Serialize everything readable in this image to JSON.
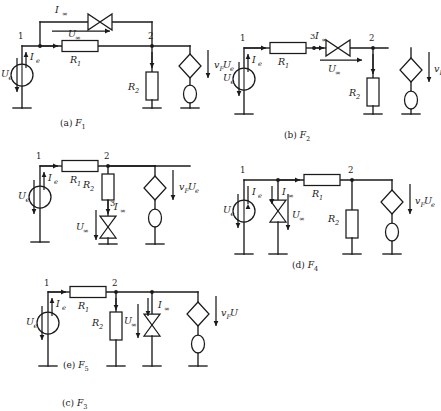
{
  "figure": {
    "background_color": "#ffffff",
    "line_color": "#1a1a1a",
    "width": 441,
    "height": 385
  },
  "symbols": {
    "infinity": "∞",
    "current_source": "bowtie-current-source",
    "voltage_source": "circle-voltage-source",
    "dependent_source": "diamond-dependent-source",
    "ellipse_source": "ellipse-source",
    "resistor": "rectangle-resistor",
    "ground": "ground-symbol"
  },
  "circuits": [
    {
      "id": "a",
      "caption_prefix": "(a)",
      "caption_symbol": "F",
      "caption_subscript": "1",
      "nodes": [
        "1",
        "2"
      ],
      "labels": {
        "source_voltage": "U",
        "source_voltage_sub": "e",
        "source_current": "I",
        "source_current_sub": "e",
        "branch_current": "I",
        "branch_current_sub": "∞",
        "branch_voltage": "U",
        "branch_voltage_sub": "∞",
        "resistor_1": "R",
        "resistor_1_sub": "1",
        "resistor_2": "R",
        "resistor_2_sub": "2",
        "dependent": "v",
        "dependent_sub": "F",
        "dependent_value": "U",
        "dependent_value_sub": "e"
      }
    },
    {
      "id": "b",
      "caption_prefix": "(b)",
      "caption_symbol": "F",
      "caption_subscript": "2",
      "nodes": [
        "1",
        "2"
      ],
      "labels": {
        "source_voltage": "U",
        "source_voltage_sub": "e",
        "source_current": "I",
        "source_current_sub": "e",
        "branch_current_coeff": "3",
        "branch_current": "I",
        "branch_current_sub": "∞",
        "branch_voltage": "U",
        "branch_voltage_sub": "∞",
        "resistor_1": "R",
        "resistor_1_sub": "1",
        "resistor_2": "R",
        "resistor_2_sub": "2",
        "dependent": "v",
        "dependent_sub": "F",
        "dependent_value": "U",
        "dependent_value_sub": "e"
      }
    },
    {
      "id": "c",
      "caption_prefix": "(c)",
      "caption_symbol": "F",
      "caption_subscript": "3",
      "nodes": [
        "1",
        "2"
      ],
      "labels": {
        "source_voltage": "U",
        "source_voltage_sub": "e",
        "source_current": "I",
        "source_current_sub": "e",
        "branch_current_coeff": "3",
        "branch_current": "I",
        "branch_current_sub": "∞",
        "branch_voltage": "U",
        "branch_voltage_sub": "∞",
        "resistor_1": "R",
        "resistor_1_sub": "1",
        "resistor_2": "R",
        "resistor_2_sub": "2",
        "dependent": "v",
        "dependent_sub": "F",
        "dependent_value": "U",
        "dependent_value_sub": "e"
      }
    },
    {
      "id": "d",
      "caption_prefix": "(d)",
      "caption_symbol": "F",
      "caption_subscript": "4",
      "nodes": [
        "1",
        "2"
      ],
      "labels": {
        "source_voltage": "U",
        "source_voltage_sub": "e",
        "source_current": "I",
        "source_current_sub": "e",
        "branch_current": "I",
        "branch_current_sub": "∞",
        "branch_voltage": "U",
        "branch_voltage_sub": "∞",
        "resistor_1": "R",
        "resistor_1_sub": "1",
        "resistor_2": "R",
        "resistor_2_sub": "2",
        "dependent": "v",
        "dependent_sub": "F",
        "dependent_value": "U",
        "dependent_value_sub": "e"
      }
    },
    {
      "id": "e",
      "caption_prefix": "(e)",
      "caption_symbol": "F",
      "caption_subscript": "5",
      "nodes": [
        "1",
        "2"
      ],
      "labels": {
        "source_voltage": "U",
        "source_voltage_sub": "e",
        "source_current": "I",
        "source_current_sub": "e",
        "branch_current": "I",
        "branch_current_sub": "∞",
        "branch_voltage": "U",
        "branch_voltage_sub": "∞",
        "resistor_1": "R",
        "resistor_1_sub": "1",
        "resistor_2": "R",
        "resistor_2_sub": "2",
        "dependent": "v",
        "dependent_sub": "F",
        "dependent_value": "U",
        "dependent_value_sub": ""
      }
    }
  ]
}
